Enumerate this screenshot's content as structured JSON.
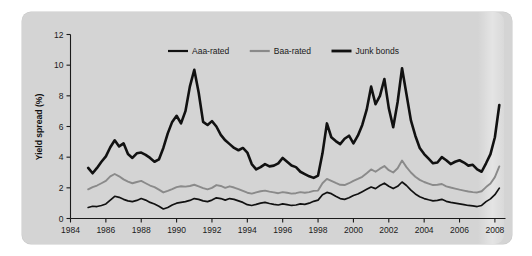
{
  "figure": {
    "panel_background": "#d4d4d4",
    "page_background": "#ffffff"
  },
  "chart_data": {
    "type": "line",
    "title": "",
    "xlabel": "",
    "ylabel": "Yield spread (%)",
    "xlim": [
      1984,
      2008.6
    ],
    "ylim": [
      0,
      12
    ],
    "xticks": [
      1984,
      1986,
      1988,
      1990,
      1992,
      1994,
      1996,
      1998,
      2000,
      2002,
      2004,
      2006,
      2008
    ],
    "xtick_labels": [
      "1984",
      "1986",
      "1988",
      "1990",
      "1992",
      "1994",
      "1996",
      "1998",
      "2000",
      "2002",
      "2004",
      "2006",
      "2008"
    ],
    "yticks": [
      0,
      2,
      4,
      6,
      8,
      10,
      12
    ],
    "ytick_labels": [
      "0",
      "2",
      "4",
      "6",
      "8",
      "10",
      "12"
    ],
    "grid": false,
    "legend_position": "top-center",
    "x": [
      1985.0,
      1985.25,
      1985.5,
      1985.75,
      1986.0,
      1986.25,
      1986.5,
      1986.75,
      1987.0,
      1987.25,
      1987.5,
      1987.75,
      1988.0,
      1988.25,
      1988.5,
      1988.75,
      1989.0,
      1989.25,
      1989.5,
      1989.75,
      1990.0,
      1990.25,
      1990.5,
      1990.75,
      1991.0,
      1991.25,
      1991.5,
      1991.75,
      1992.0,
      1992.25,
      1992.5,
      1992.75,
      1993.0,
      1993.25,
      1993.5,
      1993.75,
      1994.0,
      1994.25,
      1994.5,
      1994.75,
      1995.0,
      1995.25,
      1995.5,
      1995.75,
      1996.0,
      1996.25,
      1996.5,
      1996.75,
      1997.0,
      1997.25,
      1997.5,
      1997.75,
      1998.0,
      1998.25,
      1998.5,
      1998.75,
      1999.0,
      1999.25,
      1999.5,
      1999.75,
      2000.0,
      2000.25,
      2000.5,
      2000.75,
      2001.0,
      2001.25,
      2001.5,
      2001.75,
      2002.0,
      2002.25,
      2002.5,
      2002.75,
      2003.0,
      2003.25,
      2003.5,
      2003.75,
      2004.0,
      2004.25,
      2004.5,
      2004.75,
      2005.0,
      2005.25,
      2005.5,
      2005.75,
      2006.0,
      2006.25,
      2006.5,
      2006.75,
      2007.0,
      2007.25,
      2007.5,
      2007.75,
      2008.0,
      2008.25
    ],
    "series": [
      {
        "name": "Aaa-rated",
        "color": "#111111",
        "width": 1.7,
        "values": [
          0.72,
          0.8,
          0.78,
          0.85,
          0.95,
          1.2,
          1.45,
          1.38,
          1.25,
          1.15,
          1.1,
          1.18,
          1.3,
          1.2,
          1.05,
          0.95,
          0.8,
          0.62,
          0.72,
          0.88,
          1.0,
          1.05,
          1.1,
          1.18,
          1.3,
          1.25,
          1.15,
          1.1,
          1.2,
          1.35,
          1.3,
          1.2,
          1.3,
          1.25,
          1.15,
          1.05,
          0.9,
          0.85,
          0.92,
          1.0,
          1.05,
          0.98,
          0.92,
          0.88,
          0.95,
          0.9,
          0.85,
          0.88,
          0.95,
          0.92,
          1.0,
          1.12,
          1.2,
          1.55,
          1.7,
          1.62,
          1.45,
          1.3,
          1.25,
          1.35,
          1.5,
          1.6,
          1.75,
          1.9,
          2.05,
          1.95,
          2.15,
          2.3,
          2.1,
          1.95,
          2.1,
          2.38,
          2.15,
          1.85,
          1.6,
          1.42,
          1.3,
          1.22,
          1.15,
          1.18,
          1.25,
          1.12,
          1.05,
          1.0,
          0.95,
          0.9,
          0.85,
          0.82,
          0.78,
          0.85,
          1.1,
          1.28,
          1.55,
          1.98
        ]
      },
      {
        "name": "Baa-rated",
        "color": "#8a8a8a",
        "width": 1.9,
        "values": [
          1.9,
          2.05,
          2.15,
          2.3,
          2.45,
          2.75,
          2.9,
          2.75,
          2.55,
          2.4,
          2.3,
          2.38,
          2.45,
          2.3,
          2.15,
          2.05,
          1.88,
          1.7,
          1.8,
          1.92,
          2.05,
          2.1,
          2.08,
          2.12,
          2.2,
          2.1,
          1.98,
          1.9,
          2.0,
          2.18,
          2.12,
          2.0,
          2.1,
          2.02,
          1.92,
          1.8,
          1.68,
          1.62,
          1.7,
          1.78,
          1.82,
          1.75,
          1.7,
          1.65,
          1.72,
          1.68,
          1.62,
          1.65,
          1.72,
          1.68,
          1.72,
          1.8,
          1.82,
          2.3,
          2.58,
          2.45,
          2.32,
          2.2,
          2.18,
          2.3,
          2.45,
          2.58,
          2.72,
          2.95,
          3.2,
          3.05,
          3.25,
          3.42,
          3.15,
          3.0,
          3.28,
          3.78,
          3.35,
          3.0,
          2.72,
          2.52,
          2.38,
          2.28,
          2.18,
          2.2,
          2.25,
          2.1,
          2.02,
          1.95,
          1.88,
          1.82,
          1.76,
          1.72,
          1.7,
          1.78,
          2.05,
          2.28,
          2.7,
          3.4
        ]
      },
      {
        "name": "Junk bonds",
        "color": "#111111",
        "width": 2.6,
        "values": [
          3.3,
          2.95,
          3.3,
          3.7,
          4.05,
          4.65,
          5.1,
          4.7,
          4.9,
          4.2,
          3.95,
          4.25,
          4.3,
          4.15,
          3.95,
          3.7,
          3.85,
          4.6,
          5.55,
          6.3,
          6.7,
          6.2,
          7.0,
          8.6,
          9.7,
          8.2,
          6.3,
          6.1,
          6.35,
          6.0,
          5.45,
          5.1,
          4.85,
          4.6,
          4.45,
          4.6,
          4.3,
          3.55,
          3.2,
          3.35,
          3.55,
          3.4,
          3.45,
          3.6,
          3.95,
          3.7,
          3.45,
          3.35,
          3.05,
          2.9,
          2.75,
          2.65,
          2.8,
          4.25,
          6.2,
          5.3,
          5.05,
          4.85,
          5.2,
          5.4,
          4.9,
          5.4,
          6.1,
          7.1,
          8.6,
          7.45,
          8.0,
          9.1,
          7.2,
          5.95,
          7.6,
          9.8,
          8.1,
          6.4,
          5.4,
          4.6,
          4.2,
          3.9,
          3.6,
          3.65,
          4.0,
          3.8,
          3.55,
          3.7,
          3.8,
          3.65,
          3.45,
          3.5,
          3.2,
          3.05,
          3.6,
          4.2,
          5.3,
          7.4
        ]
      }
    ],
    "legend": [
      {
        "label": "Aaa-rated",
        "color": "#111111",
        "width": 2.2
      },
      {
        "label": "Baa-rated",
        "color": "#8a8a8a",
        "width": 2.2
      },
      {
        "label": "Junk bonds",
        "color": "#111111",
        "width": 2.8
      }
    ]
  }
}
